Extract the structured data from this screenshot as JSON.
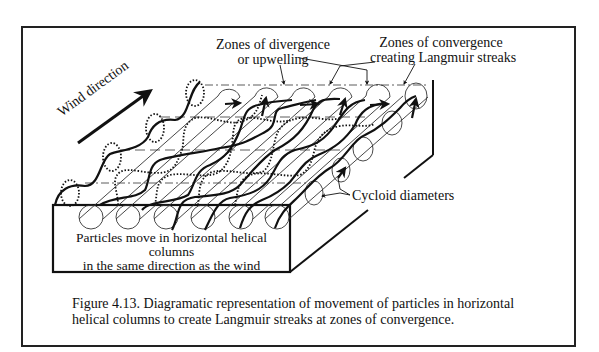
{
  "figure": {
    "labels": {
      "wind_direction": "Wind direction",
      "divergence_line1": "Zones of divergence",
      "divergence_line2": "or upwelling",
      "convergence_line1": "Zones of convergence",
      "convergence_line2": "creating Langmuir streaks",
      "cycloid": "Cycloid diameters",
      "front_line1": "Particles move in horizontal helical columns",
      "front_line2": "in the same direction as the wind"
    },
    "caption": {
      "line1": "Figure 4.13.  Diagramatic representation of movement of particles in horizontal",
      "line2": "helical columns to create Langmuir streaks at zones of convergence."
    },
    "colors": {
      "ink": "#111111",
      "background": "#ffffff"
    }
  }
}
